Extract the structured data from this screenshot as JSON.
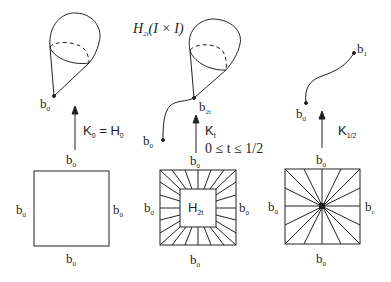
{
  "diagram": {
    "stroke_color": "#222222",
    "panels": [
      {
        "id": "left",
        "top_labels": {
          "base": "b",
          "sub": "0"
        },
        "arrow_label": {
          "text": "K",
          "sub": "0",
          "eq": " = H",
          "eq_sub": "0"
        },
        "square": {
          "top": "b",
          "bottom": "b",
          "left": "b",
          "right": "b",
          "sub": "0"
        }
      },
      {
        "id": "middle",
        "title": "H",
        "title_sub": "2t",
        "title_arg": "(I × I)",
        "apex_label": {
          "base": "b",
          "sub": "2t"
        },
        "tail_label": {
          "base": "b",
          "sub": "0"
        },
        "arrow_label": {
          "text": "K",
          "sub": "t"
        },
        "range_label": "0 ≤ t ≤ 1/2",
        "square": {
          "top": "b",
          "bottom": "b",
          "left": "b",
          "right": "b",
          "sub": "0",
          "inner": "H",
          "inner_sub": "2t"
        }
      },
      {
        "id": "right",
        "path_end_label": {
          "base": "b",
          "sub": "1"
        },
        "path_start_label": {
          "base": "b",
          "sub": "0"
        },
        "arrow_label": {
          "text": "K",
          "sub": "1/2"
        },
        "square": {
          "top": "b",
          "bottom": "b",
          "left": "b",
          "right": "b",
          "sub": "0",
          "right_sub": "c"
        }
      }
    ]
  }
}
